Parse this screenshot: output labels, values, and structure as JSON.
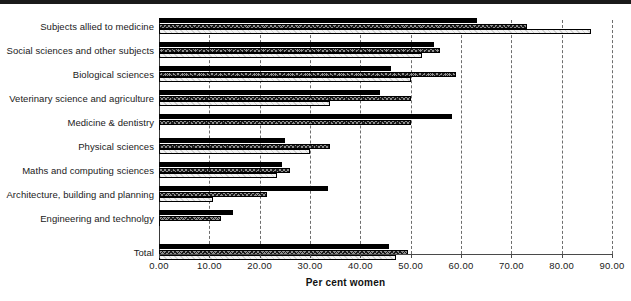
{
  "chart_data": {
    "type": "bar",
    "orientation": "horizontal",
    "title": "",
    "xlabel": "Per cent women",
    "ylabel": "",
    "xlim": [
      0,
      90
    ],
    "xticks": [
      "0.00",
      "10.00",
      "20.00",
      "30.00",
      "40.00",
      "50.00",
      "60.00",
      "70.00",
      "80.00",
      "90.00"
    ],
    "xtick_values": [
      0,
      10,
      20,
      30,
      40,
      50,
      60,
      70,
      80,
      90
    ],
    "grid": "vertical-dashed",
    "legend": "none",
    "categories": [
      "Subjects allied to medicine",
      "Social sciences and other subjects",
      "Biological sciences",
      "Veterinary science and agriculture",
      "Medicine & dentistry",
      "Physical sciences",
      "Maths and computing sciences",
      "Architecture, building and planning",
      "Engineering and technolgy",
      "Total"
    ],
    "series": [
      {
        "name": "series-1",
        "style": "solid-black",
        "color": "#000000",
        "values": [
          63.2,
          54.7,
          46.0,
          44.0,
          58.3,
          25.0,
          24.5,
          33.5,
          14.8,
          45.6
        ]
      },
      {
        "name": "series-2",
        "style": "cross-hatch",
        "color": "#8f8f8f",
        "values": [
          73.1,
          55.9,
          59.0,
          50.0,
          50.0,
          34.0,
          26.0,
          21.4,
          12.4,
          49.5
        ]
      },
      {
        "name": "series-3",
        "style": "light-hatch",
        "color": "#f2f2f2",
        "values": [
          85.9,
          52.3,
          50.0,
          34.0,
          0.0,
          30.0,
          23.5,
          10.8,
          0.0,
          47.0
        ]
      }
    ]
  },
  "axis": {
    "x_title": "Per cent women"
  }
}
